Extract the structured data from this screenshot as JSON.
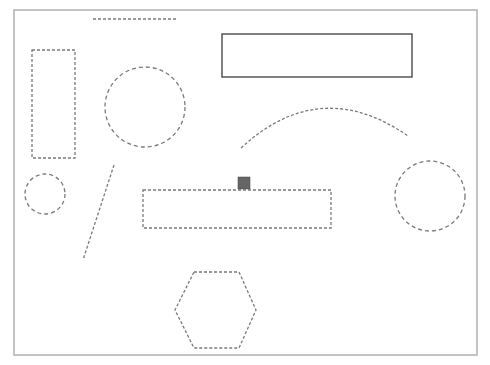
{
  "canvas": {
    "width": 490,
    "height": 365,
    "background": "#ffffff",
    "frame": {
      "x": 14,
      "y": 10,
      "w": 463,
      "h": 345,
      "stroke": "#b0b0b0"
    }
  },
  "colors": {
    "dashed_stroke": "#7a7a7a",
    "solid_stroke": "#555555",
    "handle_fill": "#666666"
  },
  "shapes": [
    {
      "id": "top-line",
      "type": "line",
      "style": "dotted",
      "x1": 93,
      "y1": 19,
      "x2": 176,
      "y2": 19
    },
    {
      "id": "left-rect",
      "type": "rect",
      "style": "dotted",
      "x": 32,
      "y": 50,
      "w": 43,
      "h": 108
    },
    {
      "id": "big-circle",
      "type": "circle",
      "style": "dashed",
      "cx": 145,
      "cy": 107,
      "r": 40
    },
    {
      "id": "solid-rect",
      "type": "rect",
      "style": "solid",
      "x": 222,
      "y": 34,
      "w": 190,
      "h": 43
    },
    {
      "id": "arc",
      "type": "arc",
      "style": "dotted",
      "d": "M 241 148 Q 320 75 408 136"
    },
    {
      "id": "small-circle",
      "type": "circle",
      "style": "dashed",
      "cx": 45,
      "cy": 194,
      "r": 20
    },
    {
      "id": "diagonal-line",
      "type": "line",
      "style": "dotted",
      "x1": 114,
      "y1": 165,
      "x2": 83,
      "y2": 260
    },
    {
      "id": "selected-rect",
      "type": "rect",
      "style": "dotted",
      "x": 143,
      "y": 190,
      "w": 188,
      "h": 38
    },
    {
      "id": "right-circle",
      "type": "circle",
      "style": "dashed",
      "cx": 430,
      "cy": 196,
      "r": 35
    },
    {
      "id": "hexagon",
      "type": "polygon",
      "style": "dotted",
      "points": "194,272 239,272 256,310 239,348 194,348 175,310"
    }
  ],
  "handle": {
    "x": 238,
    "y": 177,
    "w": 12,
    "h": 12
  }
}
